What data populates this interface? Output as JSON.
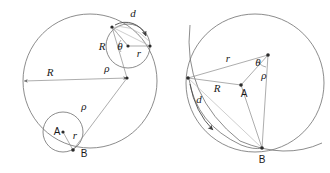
{
  "figure": {
    "panels": [
      {
        "id": "left-panel",
        "name": "Hypocycloid construction panel",
        "description": "Large fixed circle with a smaller rolling circle shown at two positions; radius R drawn from left rim to center, rolling-circle radius r, generating-point distance rho, roll angle theta and chord d.",
        "labels": {
          "R_big": "R",
          "R_small": "R",
          "r_top": "r",
          "r_bottom": "r",
          "rho_upper": "ρ",
          "rho_lower": "ρ",
          "theta": "θ",
          "d": "d",
          "point_A": "A",
          "point_B": "B"
        }
      },
      {
        "id": "right-panel",
        "name": "Angle and chord detail panel",
        "description": "Detail view showing the fixed circle arc, the chord distances r and R meeting at the left vertex, the roll distance d along the traced curve, angle theta and radius rho at the upper right vertex, and contact point B at the bottom.",
        "labels": {
          "r": "r",
          "R": "R",
          "d": "d",
          "rho": "ρ",
          "theta": "θ",
          "point_A": "A",
          "point_B": "B"
        }
      }
    ],
    "symbols": {
      "R": "R",
      "r": "r",
      "rho": "ρ",
      "theta": "θ",
      "d": "d",
      "A": "A",
      "B": "B"
    },
    "colors": {
      "background": "#ffffff",
      "primary_stroke": "#6f6f6f",
      "secondary_stroke": "#8a8a8a",
      "faint_stroke": "#b9b9b9",
      "label_text": "#1a1a1a",
      "point_marker": "#2b2b2b"
    }
  }
}
